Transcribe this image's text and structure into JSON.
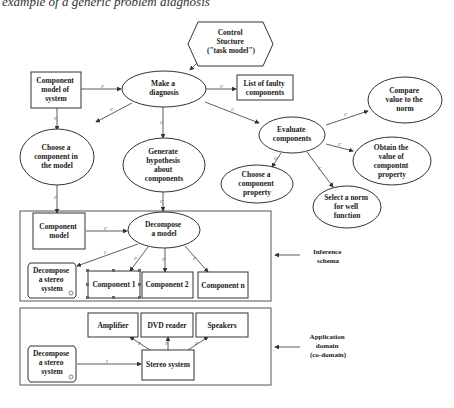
{
  "caption": "example of a generic problem diagnosis",
  "nodes": {
    "control_structure": {
      "lines": [
        "Control",
        "Stucture",
        "(\"task model\")"
      ],
      "shape": "hexagon"
    },
    "component_model_of_system": {
      "lines": [
        "Component",
        "model of",
        "system"
      ],
      "shape": "rect"
    },
    "make_diagnosis": {
      "lines": [
        "Make a",
        "diagnosis"
      ],
      "shape": "ellipse"
    },
    "list_faulty": {
      "lines": [
        "List of faulty",
        "components"
      ],
      "shape": "rect"
    },
    "choose_component_model": {
      "lines": [
        "Choose a",
        "component in",
        "the model"
      ],
      "shape": "ellipse"
    },
    "generate_hypothesis": {
      "lines": [
        "Generate",
        "hypothesis",
        "about",
        "components"
      ],
      "shape": "ellipse"
    },
    "evaluate_components": {
      "lines": [
        "Evaluate",
        "components"
      ],
      "shape": "ellipse"
    },
    "compare_value": {
      "lines": [
        "Compare",
        "value to the",
        "norm"
      ],
      "shape": "ellipse"
    },
    "obtain_value": {
      "lines": [
        "Obtain the",
        "value of",
        "compontnt",
        "property"
      ],
      "shape": "ellipse"
    },
    "choose_property": {
      "lines": [
        "Choose a",
        "component",
        "property"
      ],
      "shape": "ellipse"
    },
    "select_norm": {
      "lines": [
        "Select a norm",
        "for well",
        "function"
      ],
      "shape": "ellipse"
    },
    "component_model": {
      "lines": [
        "Component",
        "model"
      ],
      "shape": "rect"
    },
    "decompose_model": {
      "lines": [
        "Decompose",
        "a model"
      ],
      "shape": "ellipse"
    },
    "decompose_stereo_1": {
      "lines": [
        "Decompose",
        "a stereo",
        "system"
      ],
      "shape": "scroll"
    },
    "component_1": {
      "lines": [
        "Component 1"
      ],
      "shape": "rect-selected"
    },
    "component_2": {
      "lines": [
        "Component 2"
      ],
      "shape": "rect"
    },
    "component_n": {
      "lines": [
        "Component n"
      ],
      "shape": "rect"
    },
    "amplifier": {
      "lines": [
        "Amplifier"
      ],
      "shape": "rect"
    },
    "dvd_reader": {
      "lines": [
        "DVD reader"
      ],
      "shape": "rect"
    },
    "speakers": {
      "lines": [
        "Speakers"
      ],
      "shape": "rect"
    },
    "stereo_system": {
      "lines": [
        "Stereo system"
      ],
      "shape": "rect"
    },
    "decompose_stereo_2": {
      "lines": [
        "Decompose",
        "a stereo",
        "system"
      ],
      "shape": "scroll"
    }
  },
  "edge_labels": {
    "p": "P",
    "c": "C",
    "i": "I"
  },
  "regions": {
    "inference": {
      "lines": [
        "Inference",
        "schema"
      ]
    },
    "application": {
      "lines": [
        "Application",
        "domain",
        "(co-domain)"
      ]
    }
  }
}
